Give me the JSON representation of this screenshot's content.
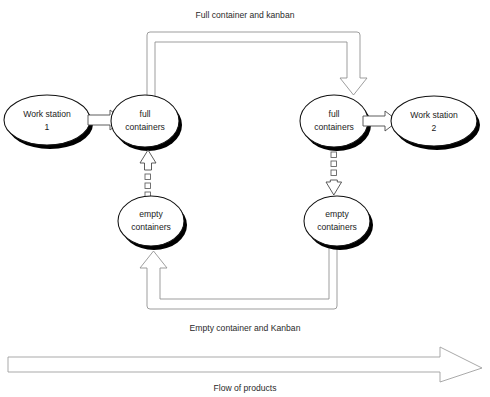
{
  "diagram": {
    "canvas": {
      "width": 490,
      "height": 397,
      "background": "#ffffff"
    },
    "colors": {
      "node_outline": "#111111",
      "node_fill": "#ffffff",
      "node_shadow": "#000000",
      "pipe_outline": "#8d8d8d",
      "block_arrow_outline": "#4a4a4a",
      "kanban_marker_outline": "#5a5a5a",
      "flow_arrow_outline": "#9a9a9a",
      "text": "#1b1b1b"
    },
    "nodes": [
      {
        "id": "work-station-1",
        "line1": "Work station",
        "line2": "1",
        "cx": 47,
        "cy": 120
      },
      {
        "id": "full-containers-left",
        "line1": "full",
        "line2": "containers",
        "cx": 145,
        "cy": 121
      },
      {
        "id": "full-containers-right",
        "line1": "full",
        "line2": "containers",
        "cx": 334,
        "cy": 121
      },
      {
        "id": "work-station-2",
        "line1": "Work station",
        "line2": "2",
        "cx": 434,
        "cy": 121
      },
      {
        "id": "empty-containers-left",
        "line1": "empty",
        "line2": "containers",
        "cx": 151,
        "cy": 221
      },
      {
        "id": "empty-containers-right",
        "line1": "empty",
        "line2": "containers",
        "cx": 337,
        "cy": 221
      }
    ],
    "captions": [
      {
        "id": "caption-full-loop",
        "text": "Full container and kanban",
        "x": 245,
        "y": 18
      },
      {
        "id": "caption-empty-loop",
        "text": "Empty container and Kanban",
        "x": 245,
        "y": 331
      },
      {
        "id": "caption-flow",
        "text": "Flow of products",
        "x": 245,
        "y": 389
      }
    ],
    "connectors": [
      {
        "id": "ws1-to-full-left",
        "kind": "block-arrow",
        "direction": "right",
        "from": "work-station-1",
        "to": "full-containers-left"
      },
      {
        "id": "full-right-to-ws2",
        "kind": "block-arrow",
        "direction": "right",
        "from": "full-containers-right",
        "to": "work-station-2"
      },
      {
        "id": "full-loop-pipe",
        "kind": "pipe",
        "direction": "down",
        "from": "full-containers-left",
        "to": "full-containers-right"
      },
      {
        "id": "empty-loop-pipe",
        "kind": "pipe",
        "direction": "up",
        "from": "empty-containers-right",
        "to": "empty-containers-left"
      },
      {
        "id": "kanban-signal-left",
        "kind": "kanban-dashed",
        "direction": "up",
        "from": "empty-containers-left",
        "to": "full-containers-left"
      },
      {
        "id": "kanban-signal-right",
        "kind": "kanban-dashed",
        "direction": "down",
        "from": "full-containers-right",
        "to": "empty-containers-right"
      },
      {
        "id": "flow-of-products-arrow",
        "kind": "flow-arrow",
        "direction": "right",
        "from": "left-edge",
        "to": "right-edge"
      }
    ]
  }
}
